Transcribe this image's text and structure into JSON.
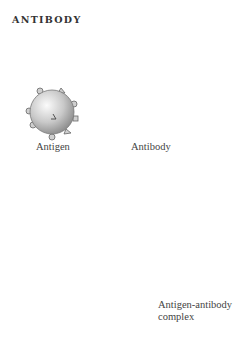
{
  "title": "ANTIBODY",
  "labels": {
    "antigen": "Antigen",
    "antibody": "Antibody",
    "complex_line1": "Antigen-antibody",
    "complex_line2": "complex"
  },
  "colors": {
    "background": "#ffffff",
    "antibody_body": "#e4e4e4",
    "antibody_outline": "#6a6a6a",
    "antibody_tip": "#8a8a8a",
    "antigen_light": "#f4f4f4",
    "antigen_dark": "#8c8c8c",
    "text": "#444444"
  }
}
